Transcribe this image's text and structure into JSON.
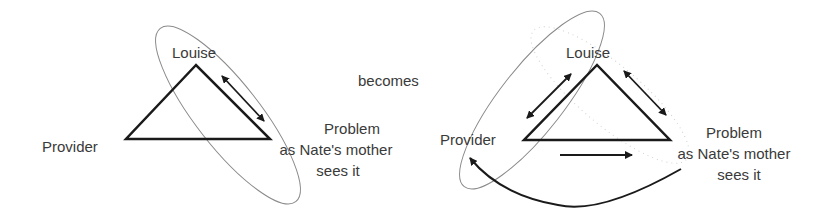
{
  "connector": {
    "label": "becomes"
  },
  "left_diagram": {
    "nodes": {
      "top": "Louise",
      "left": "Provider",
      "right_line1": "Problem",
      "right_line2": "as Nate's mother",
      "right_line3": "sees it"
    },
    "edges": [
      {
        "from": "Louise",
        "to": "Problem",
        "type": "double-arrow"
      }
    ],
    "grouping": {
      "type": "ellipse",
      "encloses": [
        "Louise",
        "Problem"
      ]
    }
  },
  "right_diagram": {
    "nodes": {
      "top": "Louise",
      "left": "Provider",
      "right_line1": "Problem",
      "right_line2": "as Nate's mother",
      "right_line3": "sees it"
    },
    "edges": [
      {
        "from": "Louise",
        "to": "Provider",
        "type": "double-arrow"
      },
      {
        "from": "Louise",
        "to": "Problem",
        "type": "double-arrow"
      },
      {
        "from": "Provider",
        "to": "Problem",
        "type": "arrow"
      },
      {
        "from": "Problem",
        "to": "Provider",
        "type": "curved-arrow"
      }
    ],
    "grouping": {
      "type": "ellipse",
      "encloses": [
        "Louise",
        "Provider"
      ]
    },
    "ghost_grouping": {
      "type": "dotted-ellipse",
      "encloses": [
        "Louise",
        "Problem"
      ]
    }
  },
  "colors": {
    "stroke": "#1a1a1a",
    "ellipse": "#8a8a8a",
    "ghost": "#d0d0d0",
    "text": "#3a3a3a"
  }
}
